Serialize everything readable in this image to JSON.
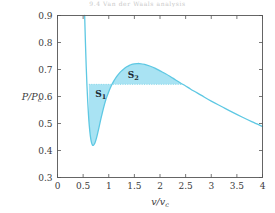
{
  "running_head": "9.4   Van der Waals analysis",
  "colors": {
    "curve_stroke": "#5ec8e3",
    "area_fill": "#a9e3f3",
    "maxwell_line": "#7fd4e8",
    "axis": "#555555",
    "text": "#3b3b3b"
  },
  "chart_data": {
    "type": "line",
    "title": "",
    "xlabel": "v/v_c",
    "ylabel": "P/P_c",
    "xlabel_num": "v",
    "xlabel_den": "v",
    "xlabel_den_sub": "c",
    "ylabel_num": "P",
    "ylabel_den": "P",
    "ylabel_den_sub": "c",
    "xlim": [
      0,
      4
    ],
    "ylim": [
      0.3,
      0.9
    ],
    "grid": false,
    "legend": "none",
    "xticks": [
      0,
      0.5,
      1,
      1.5,
      2,
      2.5,
      3,
      3.5,
      4
    ],
    "xticklabels": [
      "0",
      "0.5",
      "1",
      "1.5",
      "2",
      "2.5",
      "3",
      "3.5",
      "4"
    ],
    "yticks": [
      0.3,
      0.4,
      0.5,
      0.6,
      0.7,
      0.8,
      0.9
    ],
    "yticklabels": [
      "0.3",
      "0.4",
      "0.5",
      "0.6",
      "0.7",
      "0.8",
      "0.9"
    ],
    "series": [
      {
        "name": "van der Waals isotherm",
        "x": [
          0.53,
          0.545,
          0.56,
          0.575,
          0.59,
          0.605,
          0.62,
          0.64,
          0.66,
          0.68,
          0.7,
          0.72,
          0.74,
          0.76,
          0.78,
          0.8,
          0.83,
          0.86,
          0.9,
          0.95,
          1.0,
          1.05,
          1.1,
          1.15,
          1.2,
          1.25,
          1.3,
          1.35,
          1.4,
          1.45,
          1.5,
          1.55,
          1.6,
          1.7,
          1.8,
          1.9,
          2.0,
          2.1,
          2.2,
          2.3,
          2.4,
          2.5,
          2.6,
          2.8,
          3.0,
          3.2,
          3.4,
          3.6,
          3.8,
          4.0
        ],
        "y": [
          0.9,
          0.8,
          0.712,
          0.64,
          0.58,
          0.531,
          0.492,
          0.455,
          0.432,
          0.421,
          0.419,
          0.424,
          0.433,
          0.446,
          0.461,
          0.477,
          0.503,
          0.528,
          0.559,
          0.592,
          0.618,
          0.64,
          0.658,
          0.673,
          0.685,
          0.695,
          0.703,
          0.71,
          0.715,
          0.719,
          0.721,
          0.722,
          0.722,
          0.719,
          0.713,
          0.705,
          0.695,
          0.685,
          0.674,
          0.662,
          0.65,
          0.639,
          0.627,
          0.605,
          0.583,
          0.563,
          0.543,
          0.524,
          0.506,
          0.489
        ]
      }
    ],
    "maxwell_line": {
      "label": "equal-area pressure",
      "y": 0.645,
      "x_start": 0.612,
      "x_end": 2.43
    },
    "annotations": [
      {
        "name": "S1",
        "text": "S",
        "sub": "1",
        "x": 0.845,
        "y": 0.6
      },
      {
        "name": "S2",
        "text": "S",
        "sub": "2",
        "x": 1.48,
        "y": 0.668
      }
    ]
  }
}
